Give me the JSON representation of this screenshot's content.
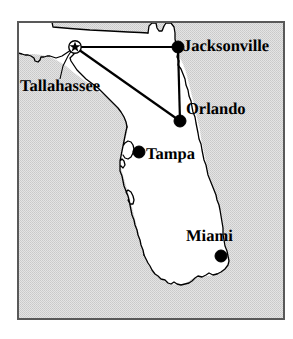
{
  "figure": {
    "kind": "reference-map",
    "region": "Florida",
    "width": 293,
    "height": 339
  },
  "colors": {
    "ocean_fill": "#d9d9d9",
    "land_fill": "#ffffff",
    "outline": "#000000",
    "frame": "#595959",
    "route_line": "#000000",
    "marker_fill": "#000000",
    "page_background": "#ffffff"
  },
  "frame": {
    "x": 17,
    "y": 21,
    "width": 268,
    "height": 299,
    "stroke_width": 2
  },
  "cities": [
    {
      "name": "Tallahassee",
      "label": "Tallahassee",
      "marker": "capital-star-circle",
      "marker_x": 75,
      "marker_y": 47,
      "label_x": 20,
      "label_y": 78,
      "leader_line": true
    },
    {
      "name": "Jacksonville",
      "label": "Jacksonville",
      "marker": "city-dot",
      "marker_x": 178,
      "marker_y": 47,
      "label_x": 183,
      "label_y": 38,
      "leader_line": false
    },
    {
      "name": "Orlando",
      "label": "Orlando",
      "marker": "city-dot",
      "marker_x": 180,
      "marker_y": 121,
      "label_x": 186,
      "label_y": 101,
      "leader_line": false
    },
    {
      "name": "Tampa",
      "label": "Tampa",
      "marker": "city-dot",
      "marker_x": 139,
      "marker_y": 152,
      "label_x": 146,
      "label_y": 146,
      "leader_line": false
    },
    {
      "name": "Miami",
      "label": "Miami",
      "marker": "city-dot",
      "marker_x": 221,
      "marker_y": 256,
      "label_x": 186,
      "label_y": 228,
      "leader_line": false
    }
  ],
  "routes": [
    {
      "id": "tallahassee-jacksonville",
      "from": "Tallahassee",
      "to": "Jacksonville"
    },
    {
      "id": "tallahassee-orlando",
      "from": "Tallahassee",
      "to": "Orlando"
    },
    {
      "id": "jacksonville-orlando",
      "from": "Jacksonville",
      "to": "Orlando"
    }
  ]
}
